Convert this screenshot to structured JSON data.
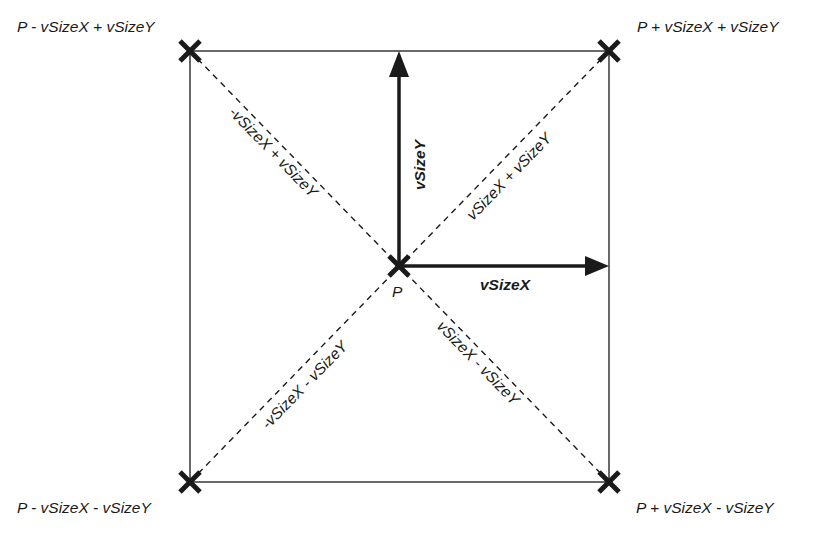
{
  "diagram": {
    "center_label": "P",
    "corners": {
      "top_left": "P - vSizeX + vSizeY",
      "top_right": "P + vSizeX + vSizeY",
      "bottom_left": "P - vSizeX - vSizeY",
      "bottom_right": "P + vSizeX - vSizeY"
    },
    "vectors": {
      "x": "vSizeX",
      "y": "vSizeY"
    },
    "diagonals": {
      "upper_left": "-vSizeX + vSizeY",
      "upper_right": "vSizeX + vSizeY",
      "lower_left": "-vSizeX - vSizeY",
      "lower_right": "vSizeX - vSizeY"
    },
    "colors": {
      "stroke": "#1a1a1a",
      "background": "#ffffff"
    }
  }
}
